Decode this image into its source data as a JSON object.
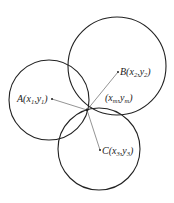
{
  "diagram": {
    "type": "trilateration",
    "stroke_color": "#222222",
    "line_color": "#555555",
    "circles": [
      {
        "id": "A",
        "cx": 49,
        "cy": 100,
        "r": 40
      },
      {
        "id": "B",
        "cx": 117,
        "cy": 66,
        "r": 49
      },
      {
        "id": "C",
        "cx": 99,
        "cy": 149,
        "r": 41
      }
    ],
    "intersection": {
      "x": 87,
      "y": 110,
      "label_main": "(x",
      "label_sub1": "m",
      "label_mid": ",y",
      "label_sub2": "m",
      "label_end": ")"
    },
    "points": [
      {
        "id": "A",
        "x": 52,
        "y": 99,
        "label_letter": "A",
        "label_open": "(x",
        "sub1": "1",
        "mid": ",y",
        "sub2": "1",
        "close": ")"
      },
      {
        "id": "B",
        "x": 118,
        "y": 72,
        "label_letter": "B",
        "label_open": "(x",
        "sub1": "2",
        "mid": ",y",
        "sub2": "2",
        "close": ")"
      },
      {
        "id": "C",
        "x": 100,
        "y": 150,
        "label_letter": "C",
        "label_open": "(x",
        "sub1": "3",
        "mid": ",y",
        "sub2": "3",
        "close": ")"
      }
    ]
  }
}
